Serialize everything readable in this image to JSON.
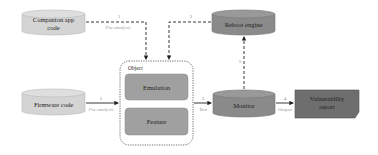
{
  "nodes": {
    "companion": {
      "label_line1": "Companion app",
      "label_line2": "code",
      "fill": "#d4d4d4"
    },
    "reboot": {
      "label": "Reboot engine",
      "fill": "#8a8a8a"
    },
    "object": {
      "label": "Object"
    },
    "emulation": {
      "label": "Emulation",
      "fill": "#a0a0a0"
    },
    "feature": {
      "label": "Feature",
      "fill": "#a0a0a0"
    },
    "firmware": {
      "label": "Firmware code",
      "fill": "#d4d4d4"
    },
    "monitor": {
      "label": "Monitor",
      "fill": "#8a8a8a"
    },
    "report": {
      "label_line1": "Vulnerability",
      "label_line2": "report",
      "fill": "#6e6e6e"
    }
  },
  "edges": {
    "companion_to_object": {
      "num": "1",
      "text": "Pre-analysis"
    },
    "reboot_to_object": {
      "num": "2"
    },
    "firmware_to_object": {
      "num": "1",
      "text": "Pre-analysis"
    },
    "object_to_monitor": {
      "num": "3",
      "text": "Test"
    },
    "monitor_to_report": {
      "num": "4",
      "text": "Output"
    },
    "monitor_to_reboot": {
      "num": "5"
    }
  }
}
